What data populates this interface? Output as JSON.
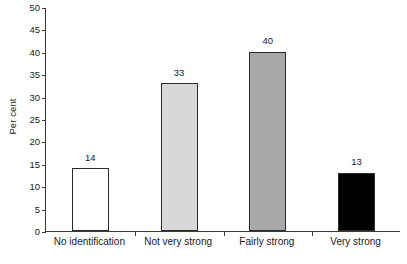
{
  "chart_data": {
    "type": "bar",
    "title": "",
    "subtitle": "",
    "xlabel": "",
    "ylabel": "Per cent",
    "categories": [
      "No identification",
      "Not very strong",
      "Fairly strong",
      "Very strong"
    ],
    "values": [
      14,
      33,
      40,
      13
    ],
    "value_labels": [
      "14",
      "33",
      "40",
      "13"
    ],
    "bar_colors": [
      "#ffffff",
      "#d8d8d8",
      "#a8a8a8",
      "#000000"
    ],
    "bar_edge_color": "#2b2b2b",
    "ylim": [
      0,
      50
    ],
    "ytick_values": [
      0,
      5,
      10,
      15,
      20,
      25,
      30,
      35,
      40,
      45,
      50
    ],
    "ytick_labels": [
      "0",
      "5",
      "10",
      "15",
      "20",
      "25",
      "30",
      "35",
      "40",
      "45",
      "50"
    ],
    "grid": false,
    "legend": null,
    "legend_position": "none",
    "spines": [
      "left",
      "bottom"
    ],
    "axis_color": "#3a3a3a"
  }
}
